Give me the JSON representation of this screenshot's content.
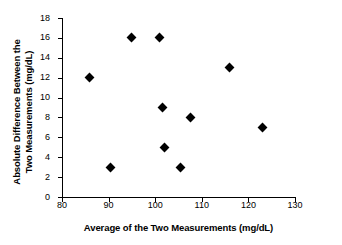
{
  "chart_data": {
    "type": "scatter",
    "title": "",
    "xlabel": "Average of the Two Measurements (mg/dL)",
    "ylabel": "Absolute Difference Between the Two Measurements (mg/dL)",
    "ylabel_line1": "Absolute Difference Between the",
    "ylabel_line2": "Two Measurements (mg/dL)",
    "xlim": [
      80,
      130
    ],
    "ylim": [
      0,
      18
    ],
    "xticks": [
      80,
      90,
      100,
      110,
      120,
      130
    ],
    "yticks": [
      0,
      2,
      4,
      6,
      8,
      10,
      12,
      14,
      16,
      18
    ],
    "grid": false,
    "legend": false,
    "marker_shape": "diamond",
    "marker_color": "#000000",
    "x": [
      86,
      90.5,
      95,
      101,
      101.5,
      102,
      105.5,
      107.5,
      116,
      123
    ],
    "y": [
      12,
      3,
      16,
      16,
      9,
      5,
      3,
      8,
      13,
      7
    ],
    "points": [
      {
        "x": 86,
        "y": 12
      },
      {
        "x": 90.5,
        "y": 3
      },
      {
        "x": 95,
        "y": 16
      },
      {
        "x": 101,
        "y": 16
      },
      {
        "x": 101.5,
        "y": 9
      },
      {
        "x": 102,
        "y": 5
      },
      {
        "x": 105.5,
        "y": 3
      },
      {
        "x": 107.5,
        "y": 8
      },
      {
        "x": 116,
        "y": 13
      },
      {
        "x": 123,
        "y": 7
      }
    ]
  }
}
